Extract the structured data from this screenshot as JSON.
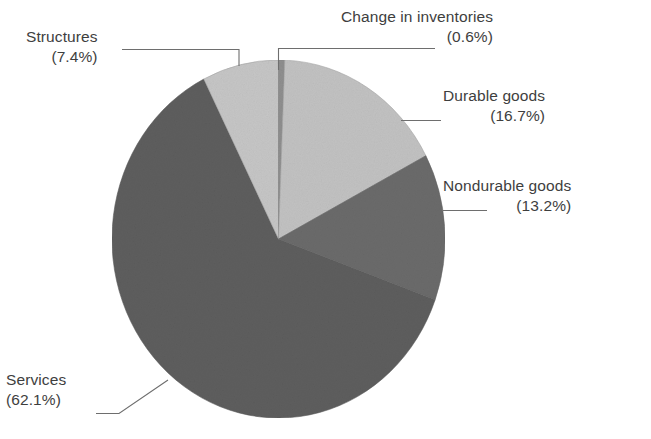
{
  "chart_data": {
    "type": "pie",
    "title": "",
    "subtitle": "",
    "xlabel": "",
    "ylabel": "",
    "legend_position": "none",
    "grid": false,
    "label_format": "name (value%)",
    "units": "percent",
    "total": 100.0,
    "start_angle_deg": 0,
    "direction": "clockwise",
    "categories": [
      "Change in inventories",
      "Durable goods",
      "Nondurable goods",
      "Services",
      "Structures"
    ],
    "values": [
      0.6,
      16.7,
      13.2,
      62.1,
      7.4
    ],
    "slices": [
      {
        "name": "Change in inventories",
        "value": 0.6,
        "display": "(0.6%)",
        "color": "#8f8f8f",
        "start_deg": 0.0,
        "end_deg": 2.16,
        "label_side": "top"
      },
      {
        "name": "Durable goods",
        "value": 16.7,
        "display": "(16.7%)",
        "color": "#c2c2c2",
        "start_deg": 2.16,
        "end_deg": 62.28,
        "label_side": "right"
      },
      {
        "name": "Nondurable goods",
        "value": 13.2,
        "display": "(13.2%)",
        "color": "#6b6b6b",
        "start_deg": 62.28,
        "end_deg": 109.8,
        "label_side": "right"
      },
      {
        "name": "Services",
        "value": 62.1,
        "display": "(62.1%)",
        "color": "#5e5e5e",
        "start_deg": 109.8,
        "end_deg": 333.36,
        "label_side": "bottom-left"
      },
      {
        "name": "Structures",
        "value": 7.4,
        "display": "(7.4%)",
        "color": "#c6c6c6",
        "start_deg": 333.36,
        "end_deg": 360.0,
        "label_side": "top-left"
      }
    ]
  },
  "labels": {
    "change_inventories": {
      "name": "Change in inventories",
      "percent": "(0.6%)"
    },
    "structures": {
      "name": "Structures",
      "percent": "(7.4%)"
    },
    "durable": {
      "name": "Durable goods",
      "percent": "(16.7%)"
    },
    "nondurable": {
      "name": "Nondurable goods",
      "percent": "(13.2%)"
    },
    "services": {
      "name": "Services",
      "percent": "(62.1%)"
    }
  },
  "colors": {
    "background": "#ffffff",
    "text": "#3e3e3e",
    "leader_line": "#6e6e6e",
    "slice_light": "#c6c6c6",
    "slice_light_alt": "#c2c2c2",
    "slice_dark": "#5e5e5e",
    "slice_dark_alt": "#6b6b6b",
    "slice_sliver": "#8f8f8f",
    "slice_border": "#9a9a9a"
  }
}
